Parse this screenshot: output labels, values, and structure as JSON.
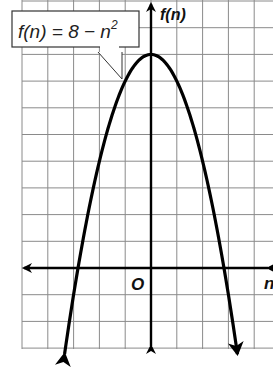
{
  "chart_data": {
    "type": "line",
    "title": "",
    "equation_label": "f(n) = 8 − n²",
    "equation_parts": {
      "lhs": "f(n) = 8 − n",
      "exp": "2"
    },
    "xlabel": "n",
    "ylabel": "f(n)",
    "origin_label": "O",
    "xlim": [
      -5,
      4.7
    ],
    "ylim": [
      -3,
      10
    ],
    "grid": true,
    "grid_step": 1,
    "function": "f(n) = 8 - n^2",
    "series": [
      {
        "name": "f(n) = 8 - n^2",
        "x": [
          -3.4,
          -3,
          -2.83,
          -2,
          -1,
          0,
          1,
          2,
          2.83,
          3,
          3.4
        ],
        "values": [
          -3.56,
          -1,
          0,
          4,
          7,
          8,
          7,
          4,
          0,
          -1,
          -3.56
        ]
      }
    ],
    "vertex": [
      0,
      8
    ],
    "x_intercepts": [
      -2.83,
      2.83
    ],
    "arrows": {
      "curve_ends": "down",
      "x_axis": "both",
      "y_axis": "both"
    }
  },
  "colors": {
    "grid": "#8a8a8a",
    "curve": "#000000",
    "axis": "#000000",
    "background": "#ffffff"
  }
}
